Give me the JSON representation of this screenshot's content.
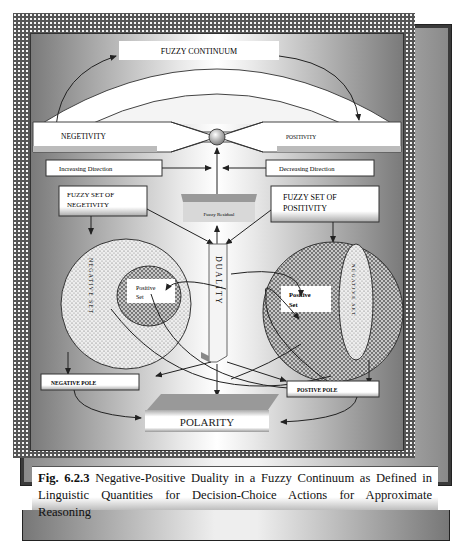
{
  "diagram": {
    "top_arc_label": "FUZZY CONTINUUM",
    "left_bar_label": "NEGETIVITY",
    "right_bar_label": "POSITIVITY",
    "increasing_label": "Increasing Direction",
    "decreasing_label": "Decreasing Direction",
    "fuzzy_residual_label": "Fuzzy Residual",
    "fuzzy_set_negativity_line1": "FUZZY SET OF",
    "fuzzy_set_negativity_line2": "NEGETIVITY",
    "fuzzy_set_positivity_line1": "FUZZY SET OF",
    "fuzzy_set_positivity_line2": "POSITIVITY",
    "duality_label": "DUALITY",
    "left_circle_vertical_label": "NEGATIVE SET",
    "left_inner_line1": "Positive",
    "left_inner_line2": "Set",
    "right_inner_line1": "Positive",
    "right_inner_line2": "Set",
    "right_ellipse_vertical_label": "NEGATIVE SET",
    "negative_pole_label": "NEGATIVE POLE",
    "positive_pole_label": "POSTIVE POLE",
    "polarity_label": "POLARITY"
  },
  "caption": {
    "fig_number": "Fig. 6.2.3",
    "text": " Negative-Positive Duality in a Fuzzy Continuum as Defined in Linguistic Quantities for Decision-Choice Actions for Approximate Reasoning"
  }
}
